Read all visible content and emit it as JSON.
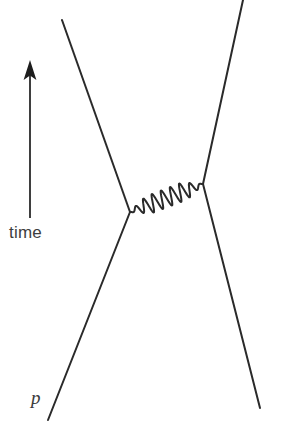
{
  "figure": {
    "kind": "feynman-diagram",
    "background_color": "#ffffff",
    "line_color": "#2a2a2a",
    "text_color": "#3a3a3a",
    "width": 299,
    "height": 446
  },
  "axis": {
    "time_label": "time",
    "arrow_direction": "up",
    "arrow_x": 30,
    "arrow_top_y": 61,
    "arrow_bottom_y": 218
  },
  "labels": {
    "incoming_particle": "p",
    "caption_fragment": ""
  },
  "chart_data": {
    "type": "line",
    "xlabel": "",
    "ylabel": "time",
    "axis_arrow": "time increases upward",
    "vertices": [
      {
        "name": "left-vertex",
        "x": 130,
        "y": 212
      },
      {
        "name": "right-vertex",
        "x": 203,
        "y": 184
      }
    ],
    "series": [
      {
        "name": "incoming-left-fermion",
        "style": "straight",
        "points": [
          [
            48,
            420
          ],
          [
            130,
            212
          ]
        ],
        "label": "p"
      },
      {
        "name": "outgoing-left-fermion",
        "style": "straight",
        "points": [
          [
            130,
            212
          ],
          [
            62,
            20
          ]
        ],
        "label": ""
      },
      {
        "name": "incoming-right-fermion",
        "style": "straight",
        "points": [
          [
            260,
            408
          ],
          [
            203,
            184
          ]
        ],
        "label": ""
      },
      {
        "name": "outgoing-right-fermion",
        "style": "straight",
        "points": [
          [
            203,
            184
          ],
          [
            243,
            0
          ]
        ],
        "label": ""
      },
      {
        "name": "exchange-boson",
        "style": "wavy",
        "points": [
          [
            130,
            212
          ],
          [
            203,
            184
          ]
        ],
        "oscillations": 8,
        "amplitude": 9,
        "label": ""
      }
    ],
    "legend": [],
    "grid": false
  }
}
